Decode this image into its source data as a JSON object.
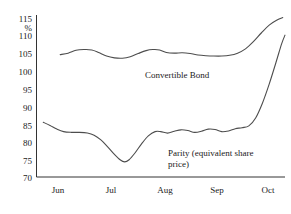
{
  "chart_data": {
    "type": "line",
    "title": "",
    "xlabel": "",
    "ylabel": "%",
    "ylim": [
      70,
      115
    ],
    "yticks": [
      70,
      75,
      80,
      85,
      90,
      95,
      100,
      105,
      110,
      115
    ],
    "ytick_labels": [
      "70",
      "75",
      "80",
      "85",
      "90",
      "95",
      "100",
      "105",
      "110",
      "115"
    ],
    "unit_label": "%",
    "categories": [
      "Jun",
      "Jul",
      "Aug",
      "Sep",
      "Oct"
    ],
    "xtick_labels": [
      "Jun",
      "Jul",
      "Aug",
      "Sep",
      "Oct"
    ],
    "xlim": [
      0,
      4.4
    ],
    "grid": false,
    "legend_position": "inline-annotation",
    "annotations": [
      {
        "name": "convertible-bond-label",
        "text": "Convertible Bond",
        "x_px": 145,
        "y_px": 70
      },
      {
        "name": "parity-label-line1",
        "text": "Parity (equivalent share",
        "x_px": 168,
        "y_px": 152
      },
      {
        "name": "parity-label-line2",
        "text": "price)",
        "x_px": 168,
        "y_px": 163
      }
    ],
    "series": [
      {
        "name": "Convertible Bond",
        "color": "#4d4d4d",
        "points": [
          [
            0.42,
            104.0
          ],
          [
            0.56,
            104.4
          ],
          [
            0.7,
            105.2
          ],
          [
            0.84,
            105.4
          ],
          [
            0.98,
            105.3
          ],
          [
            1.1,
            104.6
          ],
          [
            1.24,
            103.6
          ],
          [
            1.38,
            103.1
          ],
          [
            1.52,
            103.0
          ],
          [
            1.66,
            103.4
          ],
          [
            1.8,
            104.3
          ],
          [
            1.94,
            105.1
          ],
          [
            2.06,
            105.4
          ],
          [
            2.18,
            105.3
          ],
          [
            2.3,
            104.6
          ],
          [
            2.44,
            104.4
          ],
          [
            2.58,
            104.5
          ],
          [
            2.72,
            104.3
          ],
          [
            2.86,
            103.9
          ],
          [
            3.0,
            103.7
          ],
          [
            3.14,
            103.6
          ],
          [
            3.28,
            103.6
          ],
          [
            3.42,
            103.8
          ],
          [
            3.56,
            104.4
          ],
          [
            3.7,
            105.6
          ],
          [
            3.84,
            107.6
          ],
          [
            3.98,
            110.0
          ],
          [
            4.12,
            112.2
          ],
          [
            4.26,
            113.6
          ],
          [
            4.36,
            114.3
          ]
        ]
      },
      {
        "name": "Parity (equivalent share price)",
        "color": "#4d4d4d",
        "points": [
          [
            0.12,
            85.2
          ],
          [
            0.24,
            84.3
          ],
          [
            0.36,
            83.3
          ],
          [
            0.48,
            82.6
          ],
          [
            0.62,
            82.4
          ],
          [
            0.76,
            82.4
          ],
          [
            0.9,
            82.2
          ],
          [
            1.02,
            81.6
          ],
          [
            1.14,
            80.3
          ],
          [
            1.26,
            78.4
          ],
          [
            1.38,
            76.3
          ],
          [
            1.48,
            74.8
          ],
          [
            1.56,
            74.2
          ],
          [
            1.64,
            74.8
          ],
          [
            1.74,
            76.6
          ],
          [
            1.86,
            79.2
          ],
          [
            1.98,
            81.4
          ],
          [
            2.1,
            82.6
          ],
          [
            2.2,
            82.6
          ],
          [
            2.32,
            82.2
          ],
          [
            2.44,
            82.7
          ],
          [
            2.56,
            83.1
          ],
          [
            2.68,
            82.9
          ],
          [
            2.8,
            82.4
          ],
          [
            2.92,
            82.7
          ],
          [
            3.04,
            83.3
          ],
          [
            3.16,
            83.2
          ],
          [
            3.28,
            82.6
          ],
          [
            3.4,
            82.8
          ],
          [
            3.52,
            83.4
          ],
          [
            3.64,
            83.7
          ],
          [
            3.76,
            84.2
          ],
          [
            3.88,
            86.4
          ],
          [
            4.0,
            90.5
          ],
          [
            4.12,
            95.8
          ],
          [
            4.24,
            101.8
          ],
          [
            4.34,
            107.0
          ],
          [
            4.4,
            109.4
          ]
        ]
      }
    ]
  }
}
